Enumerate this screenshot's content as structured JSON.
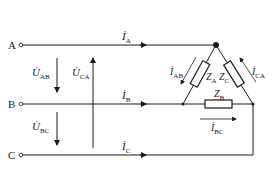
{
  "diagram": {
    "type": "three-phase delta-connected load circuit",
    "terminals": [
      {
        "id": "A",
        "label": "A"
      },
      {
        "id": "B",
        "label": "B"
      },
      {
        "id": "C",
        "label": "C"
      }
    ],
    "line_currents": [
      {
        "main": "İ",
        "sub": "A"
      },
      {
        "main": "İ",
        "sub": "B"
      },
      {
        "main": "İ",
        "sub": "C"
      }
    ],
    "line_voltages": [
      {
        "main": "U̇",
        "sub": "AB"
      },
      {
        "main": "U̇",
        "sub": "CA"
      },
      {
        "main": "U̇",
        "sub": "BC"
      }
    ],
    "impedances": [
      {
        "main": "Z",
        "sub": "A"
      },
      {
        "main": "Z",
        "sub": "C"
      },
      {
        "main": "Z",
        "sub": "B"
      }
    ],
    "phase_currents": [
      {
        "main": "İ",
        "sub": "AB"
      },
      {
        "main": "İ",
        "sub": "CA"
      },
      {
        "main": "İ",
        "sub": "BC"
      }
    ],
    "colors": {
      "line": "#1a1a1a",
      "background": "#ffffff"
    }
  }
}
